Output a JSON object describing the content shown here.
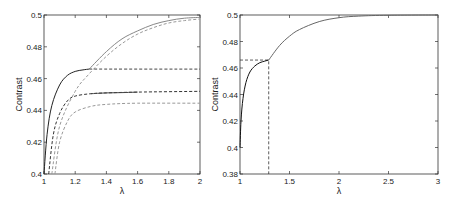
{
  "chart_data": [
    {
      "type": "line",
      "title": "",
      "xlabel": "λ",
      "ylabel": "Contrast",
      "xlim": [
        1,
        2
      ],
      "ylim": [
        0.4,
        0.5
      ],
      "xticks": [
        "1",
        "1.2",
        "1.4",
        "1.6",
        "1.8",
        "2"
      ],
      "yticks": [
        "0.4",
        "0.42",
        "0.44",
        "0.46",
        "0.48",
        "0.5"
      ],
      "grid": false,
      "legend": null,
      "series": [
        {
          "name": "solid dark (low λ branch)",
          "style": "solid",
          "color": "#222222",
          "x": [
            1.0,
            1.02,
            1.05,
            1.1,
            1.15,
            1.2,
            1.25,
            1.29
          ],
          "y": [
            0.4,
            0.425,
            0.443,
            0.456,
            0.462,
            0.4645,
            0.4655,
            0.466
          ]
        },
        {
          "name": "solid gray upper (high λ branch)",
          "style": "solid",
          "color": "#888888",
          "x": [
            1.29,
            1.4,
            1.5,
            1.6,
            1.7,
            1.8,
            1.9,
            2.0
          ],
          "y": [
            0.466,
            0.477,
            0.485,
            0.49,
            0.494,
            0.4965,
            0.498,
            0.4985
          ]
        },
        {
          "name": "dashed gray upper",
          "style": "dashed",
          "color": "#999999",
          "x": [
            1.05,
            1.1,
            1.2,
            1.29,
            1.4,
            1.5,
            1.6,
            1.7,
            1.8,
            1.9,
            2.0
          ],
          "y": [
            0.4,
            0.43,
            0.452,
            0.463,
            0.474,
            0.482,
            0.488,
            0.492,
            0.495,
            0.4965,
            0.4975
          ]
        },
        {
          "name": "dashed dark plateau 0.466",
          "style": "dashed",
          "color": "#444444",
          "x": [
            1.29,
            2.0
          ],
          "y": [
            0.466,
            0.466
          ]
        },
        {
          "name": "dashed dark middle",
          "style": "dashed",
          "color": "#333333",
          "x": [
            1.03,
            1.06,
            1.1,
            1.15,
            1.2,
            1.3,
            1.4,
            1.6,
            2.0
          ],
          "y": [
            0.4,
            0.425,
            0.438,
            0.446,
            0.449,
            0.4505,
            0.451,
            0.4515,
            0.452
          ]
        },
        {
          "name": "solid dark middle",
          "style": "solid",
          "color": "#444444",
          "x": [
            1.3,
            1.4,
            1.5,
            1.6
          ],
          "y": [
            0.4505,
            0.451,
            0.4512,
            0.4515
          ]
        },
        {
          "name": "dashed gray lower",
          "style": "dashed",
          "color": "#999999",
          "x": [
            1.07,
            1.1,
            1.15,
            1.2,
            1.3,
            1.4,
            1.6,
            2.0
          ],
          "y": [
            0.4,
            0.42,
            0.433,
            0.439,
            0.4425,
            0.4438,
            0.4445,
            0.4445
          ]
        }
      ]
    },
    {
      "type": "line",
      "title": "",
      "xlabel": "λ",
      "ylabel": "Contrast",
      "xlim": [
        1,
        3
      ],
      "ylim": [
        0.38,
        0.5
      ],
      "xticks": [
        "1",
        "1.5",
        "2",
        "2.5",
        "3"
      ],
      "yticks": [
        "0.38",
        "0.4",
        "0.42",
        "0.44",
        "0.46",
        "0.48",
        "0.5"
      ],
      "grid": false,
      "legend": null,
      "annotations": [
        {
          "type": "dashed-guide",
          "x": 1.29,
          "y": 0.466
        }
      ],
      "series": [
        {
          "name": "contrast (low λ branch)",
          "style": "solid",
          "color": "#111111",
          "x": [
            1.0,
            1.01,
            1.03,
            1.06,
            1.1,
            1.15,
            1.2,
            1.25,
            1.29
          ],
          "y": [
            0.4,
            0.42,
            0.437,
            0.449,
            0.457,
            0.4615,
            0.464,
            0.4652,
            0.466
          ]
        },
        {
          "name": "contrast (high λ branch)",
          "style": "solid",
          "color": "#666666",
          "x": [
            1.29,
            1.4,
            1.5,
            1.6,
            1.8,
            2.0,
            2.2,
            2.5,
            3.0
          ],
          "y": [
            0.466,
            0.477,
            0.484,
            0.489,
            0.495,
            0.498,
            0.4992,
            0.4998,
            0.5
          ]
        }
      ]
    }
  ]
}
